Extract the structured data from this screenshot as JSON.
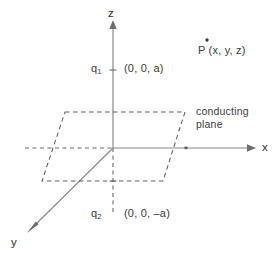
{
  "figure": {
    "axes": {
      "z_label": "z",
      "x_label": "x",
      "y_label": "y"
    },
    "labels": {
      "charge_upper_symbol": "q",
      "charge_upper_subscript": "1",
      "charge_upper_coords": "(0, 0, a)",
      "charge_lower_symbol": "q",
      "charge_lower_subscript": "2",
      "charge_lower_coords": "(0, 0, –a)",
      "point_label": "P (x, y, z)",
      "plane_line1": "conducting",
      "plane_line2": "plane"
    },
    "colors": {
      "axis": "#808080",
      "dashed": "#555555",
      "text": "#3a3a3a",
      "background": "#ffffff"
    },
    "geometry": {
      "origin": [
        113,
        148
      ],
      "z_axis_top": [
        113,
        22
      ],
      "z_axis_bottom": [
        113,
        214
      ],
      "x_axis_right": [
        258,
        148
      ],
      "x_axis_left_dashed": [
        25,
        148
      ],
      "y_axis_arrow": [
        28,
        232
      ],
      "plane_corners": [
        [
          65,
          112
        ],
        [
          185,
          112
        ],
        [
          163,
          181
        ],
        [
          42,
          181
        ]
      ],
      "point_marker": [
        207,
        40
      ],
      "charge_upper_tick": [
        113,
        70
      ],
      "charge_lower_tick": [
        113,
        181
      ]
    }
  }
}
